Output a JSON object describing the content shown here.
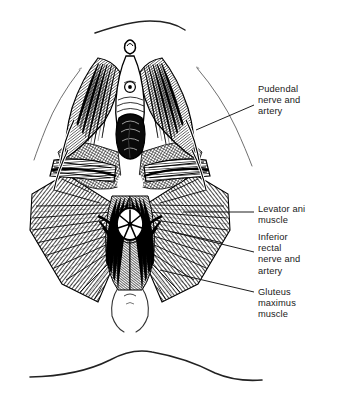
{
  "figure": {
    "background_color": "#ffffff",
    "ink_color": "#000000",
    "text_color": "#1a1a1a",
    "width": 340,
    "height": 407
  },
  "labels": [
    {
      "id": "pudendal",
      "name": "pudendal-nerve-and-artery",
      "text": "Pudendal\nnerve and\nartery",
      "x": 258,
      "y": 84,
      "leader": {
        "x1": 254,
        "y1": 105,
        "x2": 196,
        "y2": 130
      }
    },
    {
      "id": "levator-ani",
      "name": "levator-ani-muscle",
      "text": "Levator ani\nmuscle",
      "x": 258,
      "y": 204,
      "leader": {
        "x1": 254,
        "y1": 212,
        "x2": 183,
        "y2": 212
      }
    },
    {
      "id": "inferior-rectal",
      "name": "inferior-rectal-nerve-and-artery",
      "text": "Inferior\nrectal\nnerve and\nartery",
      "x": 258,
      "y": 232,
      "leader": {
        "x1": 254,
        "y1": 252,
        "x2": 172,
        "y2": 232
      }
    },
    {
      "id": "gluteus-maximus",
      "name": "gluteus-maximus-muscle",
      "text": "Gluteus\nmaximus\nmuscle",
      "x": 258,
      "y": 287,
      "leader": {
        "x1": 254,
        "y1": 292,
        "x2": 160,
        "y2": 270
      }
    }
  ],
  "structures": [
    {
      "name": "pubic-arc-outline",
      "description": "thin arc above the perineum"
    },
    {
      "name": "left-thigh-contour",
      "description": "thin curved thigh outline, left"
    },
    {
      "name": "right-thigh-contour",
      "description": "thin curved thigh outline, right"
    },
    {
      "name": "vulva-vaginal-opening",
      "description": "central oval opening, upper midline"
    },
    {
      "name": "urethral-opening",
      "description": "small circular opening above vagina"
    },
    {
      "name": "clitoris",
      "description": "small hooded structure at top midline"
    },
    {
      "name": "anus",
      "description": "radiating star-shaped opening, lower midline"
    },
    {
      "name": "levator-ani-sheet",
      "description": "hatched muscle sheet flanking anal canal"
    },
    {
      "name": "gluteus-maximus-left",
      "description": "large hatched muscle fan, lower left"
    },
    {
      "name": "gluteus-maximus-right",
      "description": "large hatched muscle fan, lower right"
    },
    {
      "name": "ischioanal-fossa-left",
      "description": "shaded triangular fossa, left"
    },
    {
      "name": "ischioanal-fossa-right",
      "description": "shaded triangular fossa, right"
    },
    {
      "name": "coccyx-outline",
      "description": "tapering outline at inferior midline"
    },
    {
      "name": "sacral-back-curve",
      "description": "S-shaped contour line at bottom of figure"
    }
  ]
}
